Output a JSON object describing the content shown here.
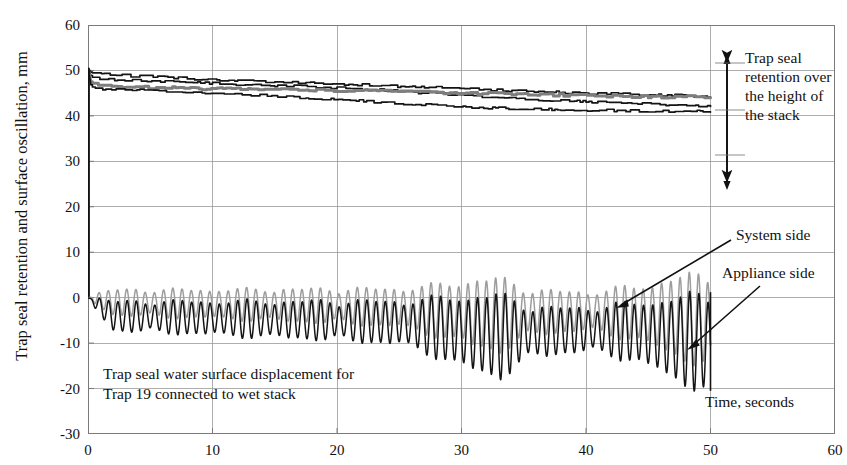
{
  "chart_title": "",
  "axes": {
    "ylabel": "Trap seal retention and surface oscillation, mm",
    "xlabel": "Time, seconds",
    "yticks": [
      "60",
      "50",
      "40",
      "30",
      "20",
      "10",
      "0",
      "-10",
      "-20",
      "-30"
    ],
    "xticks": [
      "0",
      "10",
      "20",
      "30",
      "40",
      "50",
      "60"
    ]
  },
  "annotations": {
    "stack_note": "Trap seal retention over the height of the stack",
    "system_side": "System side",
    "appliance_side": "Appliance side",
    "caption_line1": "Trap seal water surface displacement for",
    "caption_line2": "Trap 19 connected to wet stack",
    "time_label": "Time, seconds"
  },
  "colors": {
    "axis": "#7a7a7a",
    "grid": "#9a9a9a",
    "trace_dark": "#141414",
    "trace_gray": "#9d9d9d",
    "text": "#111111"
  },
  "chart_data": {
    "type": "line",
    "title": "",
    "xlabel": "Time, seconds",
    "ylabel": "Trap seal retention and surface oscillation, mm",
    "xlim": [
      0,
      60
    ],
    "ylim": [
      -30,
      60
    ],
    "xticks": [
      0,
      10,
      20,
      30,
      40,
      50,
      60
    ],
    "yticks": [
      -30,
      -20,
      -10,
      0,
      10,
      20,
      30,
      40,
      50,
      60
    ],
    "grid": true,
    "legend": "none",
    "series": [
      {
        "name": "Trap seal retention - trap A (upper stack)",
        "color": "#141414",
        "group": "retention",
        "x": [
          0,
          0.3,
          1,
          2,
          4,
          6,
          8,
          10,
          13,
          16,
          20,
          24,
          28,
          32,
          36,
          40,
          44,
          47,
          50
        ],
        "y": [
          50.5,
          49.5,
          49.2,
          49.0,
          48.7,
          48.5,
          48.2,
          48.0,
          47.7,
          47.4,
          47.0,
          46.6,
          46.2,
          45.8,
          45.4,
          45.0,
          44.7,
          44.5,
          44.3
        ]
      },
      {
        "name": "Trap seal retention - trap B",
        "color": "#141414",
        "group": "retention",
        "x": [
          0,
          0.3,
          1,
          2,
          4,
          6,
          8,
          10,
          13,
          16,
          20,
          24,
          28,
          32,
          36,
          40,
          44,
          47,
          50
        ],
        "y": [
          50.5,
          48.6,
          48.2,
          48.0,
          47.8,
          47.6,
          47.4,
          47.2,
          46.9,
          46.6,
          46.2,
          45.6,
          44.9,
          44.2,
          43.6,
          43.1,
          42.7,
          42.4,
          42.2
        ]
      },
      {
        "name": "Trap seal retention - trap C",
        "color": "#7e7e7e",
        "group": "retention",
        "x": [
          0,
          0.3,
          1,
          2,
          4,
          6,
          8,
          10,
          13,
          16,
          20,
          24,
          28,
          32,
          36,
          40,
          44,
          47,
          50
        ],
        "y": [
          50.5,
          47.0,
          46.6,
          46.4,
          46.3,
          46.2,
          46.1,
          46.0,
          45.9,
          45.8,
          45.6,
          45.4,
          45.1,
          44.9,
          44.7,
          44.5,
          44.3,
          44.2,
          44.1
        ]
      },
      {
        "name": "Trap seal retention - trap D (lower stack)",
        "color": "#141414",
        "group": "retention",
        "x": [
          0,
          0.3,
          1,
          2,
          4,
          6,
          8,
          10,
          13,
          16,
          20,
          24,
          28,
          32,
          36,
          40,
          44,
          47,
          50
        ],
        "y": [
          50.5,
          46.2,
          46.0,
          45.9,
          45.7,
          45.5,
          45.3,
          45.0,
          44.6,
          44.2,
          43.6,
          42.9,
          42.3,
          41.8,
          41.5,
          41.3,
          41.1,
          41.0,
          41.0
        ]
      },
      {
        "name": "Appliance side surface oscillation",
        "color": "#141414",
        "group": "oscillation",
        "description": "High frequency oscillation about mean ~ -4 to -8 mm, amplitude growing in bursts, terminating at t = 50 s",
        "mean_envelope_x": [
          0,
          2,
          5,
          10,
          15,
          20,
          25,
          28,
          30,
          33,
          36,
          40,
          44,
          47,
          50
        ],
        "mean_envelope_y": [
          0,
          -4.0,
          -4.2,
          -4.5,
          -4.8,
          -5.0,
          -5.5,
          -6.5,
          -7.5,
          -8.5,
          -7.5,
          -7.0,
          -7.5,
          -9.0,
          -10.0
        ],
        "amplitude_x": [
          0,
          2,
          5,
          10,
          15,
          20,
          25,
          28,
          30,
          33,
          36,
          40,
          44,
          47,
          50
        ],
        "amplitude_y": [
          0.5,
          3.0,
          3.2,
          3.5,
          3.8,
          4.0,
          4.5,
          6.0,
          7.5,
          8.5,
          5.0,
          4.5,
          6.0,
          8.5,
          10.0
        ],
        "frequency_hz": 1.35
      },
      {
        "name": "System side surface oscillation",
        "color": "#9d9d9d",
        "group": "oscillation",
        "description": "Mirror-phase oscillation on system side, smaller mean offset, terminating at t = 50 s",
        "mean_envelope_x": [
          0,
          2,
          5,
          10,
          15,
          20,
          25,
          28,
          30,
          33,
          36,
          40,
          44,
          47,
          50
        ],
        "mean_envelope_y": [
          0,
          -1.0,
          -1.2,
          -1.4,
          -1.6,
          -1.8,
          -2.2,
          -2.8,
          -3.2,
          -3.8,
          -3.2,
          -3.0,
          -3.4,
          -4.2,
          -5.0
        ],
        "amplitude_x": [
          0,
          2,
          5,
          10,
          15,
          20,
          25,
          28,
          30,
          33,
          36,
          40,
          44,
          47,
          50
        ],
        "amplitude_y": [
          0.5,
          2.6,
          2.8,
          3.0,
          3.3,
          3.5,
          4.0,
          5.2,
          6.5,
          7.5,
          4.5,
          4.0,
          5.5,
          8.0,
          9.5
        ],
        "frequency_hz": 1.35
      }
    ],
    "events": [
      {
        "x": 0,
        "label": "Initial trap seal 50 mm, step drop at t = 0"
      },
      {
        "x": 50,
        "label": "Test end, oscillation ceases"
      }
    ]
  }
}
